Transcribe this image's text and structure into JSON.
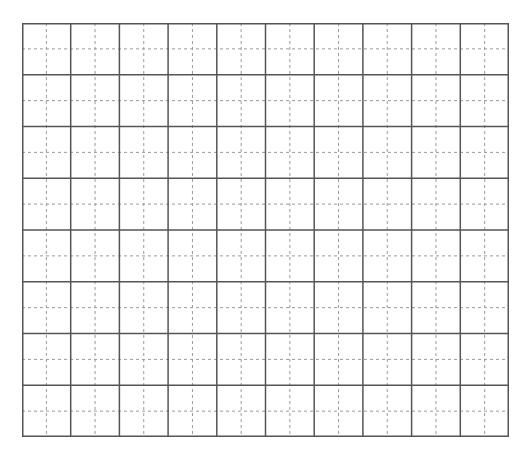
{
  "grid": {
    "type": "tianzige-writing-grid",
    "columns": 10,
    "rows": 8,
    "left": 22,
    "top": 23,
    "width": 487,
    "height": 414,
    "colors": {
      "background": "#ffffff",
      "solid_line": "#555555",
      "dashed_line": "#9a9a9a"
    }
  }
}
